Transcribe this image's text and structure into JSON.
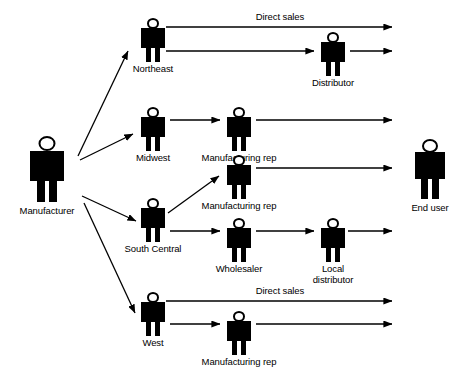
{
  "diagram": {
    "colors": {
      "ink": "#000000",
      "background": "#ffffff"
    },
    "nodes": [
      {
        "id": "manufacturer",
        "label": "Manufacturer",
        "icon": "person-icon",
        "size": "large"
      },
      {
        "id": "northeast",
        "label": "Northeast",
        "icon": "person-icon",
        "size": "small"
      },
      {
        "id": "distributor",
        "label": "Distributor",
        "icon": "person-icon",
        "size": "small"
      },
      {
        "id": "midwest",
        "label": "Midwest",
        "icon": "person-icon",
        "size": "small"
      },
      {
        "id": "mfg-rep-midwest",
        "label": "Manufacturing rep",
        "icon": "person-icon",
        "size": "small"
      },
      {
        "id": "south-central",
        "label": "South Central",
        "icon": "person-icon",
        "size": "small"
      },
      {
        "id": "mfg-rep-south",
        "label": "Manufacturing rep",
        "icon": "person-icon",
        "size": "small"
      },
      {
        "id": "wholesaler",
        "label": "Wholesaler",
        "icon": "person-icon",
        "size": "small"
      },
      {
        "id": "local-distributor",
        "label": "Local\ndistributor",
        "icon": "person-icon",
        "size": "small"
      },
      {
        "id": "west",
        "label": "West",
        "icon": "person-icon",
        "size": "small"
      },
      {
        "id": "mfg-rep-west",
        "label": "Manufacturing rep",
        "icon": "person-icon",
        "size": "small"
      },
      {
        "id": "end-user",
        "label": "End user",
        "icon": "person-icon",
        "size": "large"
      }
    ],
    "edge_labels": [
      {
        "id": "direct-sales-northeast",
        "text": "Direct sales"
      },
      {
        "id": "direct-sales-west",
        "text": "Direct sales"
      }
    ],
    "edges": [
      {
        "from": "manufacturer",
        "to": "northeast"
      },
      {
        "from": "manufacturer",
        "to": "midwest"
      },
      {
        "from": "manufacturer",
        "to": "south-central"
      },
      {
        "from": "manufacturer",
        "to": "west"
      },
      {
        "from": "northeast",
        "to": "end-user",
        "label": "Direct sales"
      },
      {
        "from": "northeast",
        "to": "distributor"
      },
      {
        "from": "distributor",
        "to": "end-user"
      },
      {
        "from": "midwest",
        "to": "mfg-rep-midwest"
      },
      {
        "from": "mfg-rep-midwest",
        "to": "end-user"
      },
      {
        "from": "south-central",
        "to": "mfg-rep-south"
      },
      {
        "from": "mfg-rep-south",
        "to": "end-user"
      },
      {
        "from": "south-central",
        "to": "wholesaler"
      },
      {
        "from": "wholesaler",
        "to": "local-distributor"
      },
      {
        "from": "local-distributor",
        "to": "end-user"
      },
      {
        "from": "west",
        "to": "end-user",
        "label": "Direct sales"
      },
      {
        "from": "west",
        "to": "mfg-rep-west"
      },
      {
        "from": "mfg-rep-west",
        "to": "end-user"
      }
    ]
  }
}
